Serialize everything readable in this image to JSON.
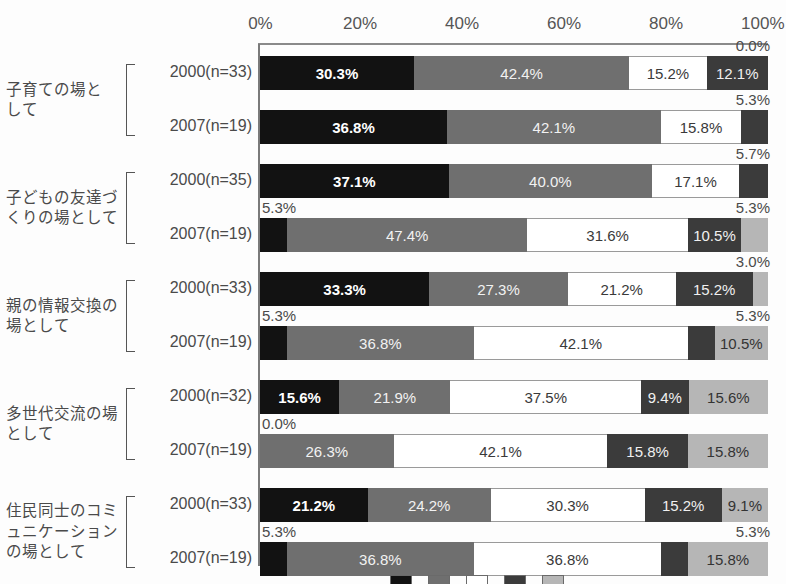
{
  "chart_data": {
    "type": "bar",
    "subtype": "stacked-horizontal-100pct",
    "title": "",
    "xlabel": "",
    "ylabel": "",
    "xlim": [
      0,
      100
    ],
    "grid": false,
    "legend_position": "bottom-right",
    "axis_ticks": [
      "0%",
      "20%",
      "40%",
      "60%",
      "80%",
      "100%"
    ],
    "axis_tick_values": [
      0,
      20,
      40,
      60,
      80,
      100
    ],
    "series": [
      {
        "name": "series-1",
        "color": "#121212"
      },
      {
        "name": "series-2",
        "color": "#6f6f6f"
      },
      {
        "name": "series-3",
        "color": "#ffffff"
      },
      {
        "name": "series-4",
        "color": "#3b3b3b"
      },
      {
        "name": "series-5",
        "color": "#b6b6b6"
      }
    ],
    "groups": [
      {
        "category": "子育ての場と\nして",
        "category_line1": "子育ての場と",
        "category_line2": "して",
        "rows": [
          {
            "label": "2000(n=33)",
            "values": [
              30.3,
              42.4,
              15.2,
              12.1,
              0.0
            ],
            "labels": [
              "30.3%",
              "42.4%",
              "15.2%",
              "12.1%",
              "0.0%"
            ],
            "outside": [
              {
                "text": "0.0%",
                "align": "right",
                "segment": 4
              }
            ]
          },
          {
            "label": "2007(n=19)",
            "values": [
              36.8,
              42.1,
              15.8,
              5.3,
              0.0
            ],
            "labels": [
              "36.8%",
              "42.1%",
              "15.8%",
              "5.3%",
              ""
            ],
            "outside": [
              {
                "text": "5.3%",
                "align": "right",
                "segment": 3
              }
            ]
          }
        ]
      },
      {
        "category": "子どもの友達づ\nくりの場として",
        "category_line1": "子どもの友達づ",
        "category_line2": "くりの場として",
        "rows": [
          {
            "label": "2000(n=35)",
            "values": [
              37.1,
              40.0,
              17.1,
              5.7,
              0.0
            ],
            "labels": [
              "37.1%",
              "40.0%",
              "17.1%",
              "5.7%",
              ""
            ],
            "outside": [
              {
                "text": "5.7%",
                "align": "right",
                "segment": 3
              }
            ]
          },
          {
            "label": "2007(n=19)",
            "values": [
              5.3,
              47.4,
              31.6,
              10.5,
              5.3
            ],
            "labels": [
              "5.3%",
              "47.4%",
              "31.6%",
              "10.5%",
              "5.3%"
            ],
            "outside": [
              {
                "text": "5.3%",
                "align": "left",
                "segment": 0
              },
              {
                "text": "5.3%",
                "align": "right",
                "segment": 4
              }
            ]
          }
        ]
      },
      {
        "category": "親の情報交換の\n場として",
        "category_line1": "親の情報交換の",
        "category_line2": "場として",
        "rows": [
          {
            "label": "2000(n=33)",
            "values": [
              33.3,
              27.3,
              21.2,
              15.2,
              3.0
            ],
            "labels": [
              "33.3%",
              "27.3%",
              "21.2%",
              "15.2%",
              "3.0%"
            ],
            "outside": [
              {
                "text": "3.0%",
                "align": "right",
                "segment": 4
              }
            ]
          },
          {
            "label": "2007(n=19)",
            "values": [
              5.3,
              36.8,
              42.1,
              5.3,
              10.5
            ],
            "labels": [
              "5.3%",
              "36.8%",
              "42.1%",
              "5.3%",
              "10.5%"
            ],
            "outside": [
              {
                "text": "5.3%",
                "align": "left",
                "segment": 0
              },
              {
                "text": "5.3%",
                "align": "right",
                "segment": 3
              }
            ]
          }
        ]
      },
      {
        "category": "多世代交流の場\nとして",
        "category_line1": "多世代交流の場",
        "category_line2": "として",
        "rows": [
          {
            "label": "2000(n=32)",
            "values": [
              15.6,
              21.9,
              37.5,
              9.4,
              15.6
            ],
            "labels": [
              "15.6%",
              "21.9%",
              "37.5%",
              "9.4%",
              "15.6%"
            ],
            "outside": []
          },
          {
            "label": "2007(n=19)",
            "values": [
              0.0,
              26.3,
              42.1,
              15.8,
              15.8
            ],
            "labels": [
              "0.0%",
              "26.3%",
              "42.1%",
              "15.8%",
              "15.8%"
            ],
            "outside": [
              {
                "text": "0.0%",
                "align": "left",
                "segment": 0
              }
            ]
          }
        ]
      },
      {
        "category": "住民同士のコミ\nュニケーション\nの場として",
        "category_line1": "住民同士のコミ",
        "category_line2": "ュニケーション",
        "category_line3": "の場として",
        "rows": [
          {
            "label": "2000(n=33)",
            "values": [
              21.2,
              24.2,
              30.3,
              15.2,
              9.1
            ],
            "labels": [
              "21.2%",
              "24.2%",
              "30.3%",
              "15.2%",
              "9.1%"
            ],
            "outside": []
          },
          {
            "label": "2007(n=19)",
            "values": [
              5.3,
              36.8,
              36.8,
              5.3,
              15.8
            ],
            "labels": [
              "5.3%",
              "36.8%",
              "36.8%",
              "5.3%",
              "15.8%"
            ],
            "outside": [
              {
                "text": "5.3%",
                "align": "left",
                "segment": 0
              },
              {
                "text": "5.3%",
                "align": "right",
                "segment": 3
              }
            ]
          }
        ]
      }
    ]
  }
}
